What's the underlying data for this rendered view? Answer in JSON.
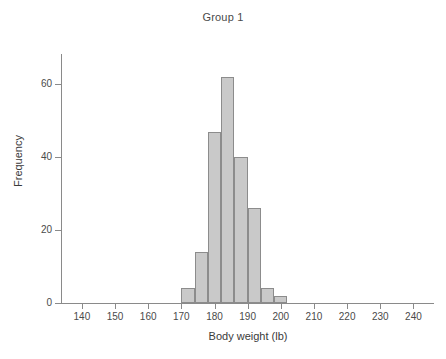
{
  "chart_data": {
    "type": "bar",
    "title": "Group 1",
    "xlabel": "Body weight (lb)",
    "ylabel": "Frequency",
    "xlim": [
      134,
      245
    ],
    "ylim": [
      0,
      68
    ],
    "grid": false,
    "legend": null,
    "bin_width": 4,
    "bin_starts": [
      170,
      174,
      178,
      182,
      186,
      190,
      194,
      198
    ],
    "bin_ends": [
      174,
      178,
      182,
      186,
      190,
      194,
      198,
      202
    ],
    "categories": [
      "170-174",
      "174-178",
      "178-182",
      "182-186",
      "186-190",
      "190-194",
      "194-198",
      "198-202"
    ],
    "values": [
      4,
      14,
      47,
      62,
      40,
      26,
      4,
      2
    ],
    "xticks": [
      140,
      150,
      160,
      170,
      180,
      190,
      200,
      210,
      220,
      230,
      240
    ],
    "yticks": [
      0,
      20,
      40,
      60
    ],
    "bar_fill_color": "#c9c9c9",
    "bar_edge_color": "#8c8c8c",
    "axis_color": "#8a8a8a",
    "text_color": "#3a3a3a",
    "background_color": "#ffffff"
  }
}
